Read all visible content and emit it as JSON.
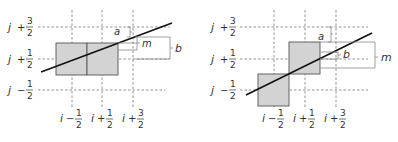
{
  "figure": {
    "panels": [
      {
        "id": "left",
        "row_labels": [
          {
            "var": "j",
            "op": "+",
            "num": "3",
            "den": "2"
          },
          {
            "var": "j",
            "op": "+",
            "num": "1",
            "den": "2"
          },
          {
            "var": "j",
            "op": "−",
            "num": "1",
            "den": "2"
          }
        ],
        "col_labels": [
          {
            "var": "i",
            "op": "−",
            "num": "1",
            "den": "2"
          },
          {
            "var": "i",
            "op": "+",
            "num": "1",
            "den": "2"
          },
          {
            "var": "i",
            "op": "+",
            "num": "3",
            "den": "2"
          }
        ],
        "annotations": {
          "a": "a",
          "m": "m",
          "b": "b"
        }
      },
      {
        "id": "right",
        "row_labels": [
          {
            "var": "j",
            "op": "+",
            "num": "3",
            "den": "2"
          },
          {
            "var": "j",
            "op": "+",
            "num": "1",
            "den": "2"
          },
          {
            "var": "j",
            "op": "−",
            "num": "1",
            "den": "2"
          }
        ],
        "col_labels": [
          {
            "var": "i",
            "op": "−",
            "num": "1",
            "den": "2"
          },
          {
            "var": "i",
            "op": "+",
            "num": "1",
            "den": "2"
          },
          {
            "var": "i",
            "op": "+",
            "num": "3",
            "den": "2"
          }
        ],
        "annotations": {
          "a": "a",
          "b": "b",
          "m": "m"
        }
      }
    ],
    "colors": {
      "pixel_fill": "#d3d3d3",
      "pixel_stroke": "#555555",
      "grid": "#777777",
      "line": "#111111",
      "bracket": "#888888"
    }
  }
}
